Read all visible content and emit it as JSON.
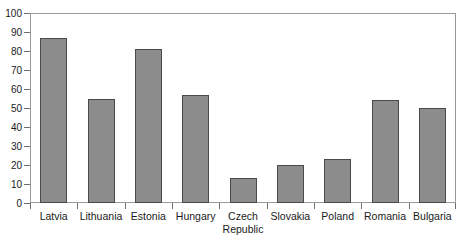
{
  "chart_data": {
    "type": "bar",
    "title": "",
    "subtitle": "",
    "xlabel": "",
    "ylabel": "",
    "ylim": [
      0,
      100
    ],
    "y_ticks": [
      0,
      10,
      20,
      30,
      40,
      50,
      60,
      70,
      80,
      90,
      100
    ],
    "grid": false,
    "legend": null,
    "categories": [
      "Latvia",
      "Lithuania",
      "Estonia",
      "Hungary",
      "Czech Republic",
      "Slovakia",
      "Poland",
      "Romania",
      "Bulgaria"
    ],
    "category_lines": [
      [
        "Latvia"
      ],
      [
        "Lithuania"
      ],
      [
        "Estonia"
      ],
      [
        "Hungary"
      ],
      [
        "Czech",
        "Republic"
      ],
      [
        "Slovakia"
      ],
      [
        "Poland"
      ],
      [
        "Romania"
      ],
      [
        "Bulgaria"
      ]
    ],
    "values": [
      87,
      55,
      81,
      57,
      13,
      20,
      23,
      54,
      50
    ],
    "bar_color": "#8c8c8c",
    "bar_border_color": "#4a4a4a",
    "axis_color": "#9a9a9a",
    "text_color": "#1a1a1a"
  }
}
